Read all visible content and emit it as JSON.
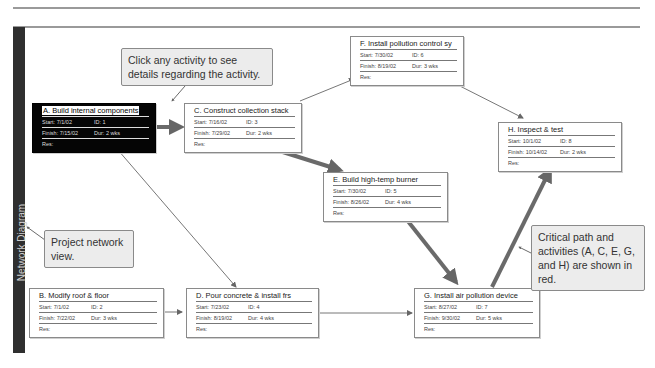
{
  "sidebar": {
    "label": "Network Diagram"
  },
  "callouts": {
    "click_hint": "Click any activity to see details regarding the activity.",
    "network_view": "Project network view.",
    "critical_path": "Critical path and activities (A, C, E, G, and H) are shown in red."
  },
  "activities": [
    {
      "id_letter": "A",
      "title": "A. Build internal components",
      "start": "Start:  7/1/02",
      "id": "ID:   1",
      "finish": "Finish: 7/15/02",
      "dur": "Dur: 2 wks",
      "res": "Res:"
    },
    {
      "id_letter": "B",
      "title": "B. Modify roof & floor",
      "start": "Start:  7/1/02",
      "id": "ID:   2",
      "finish": "Finish: 7/22/02",
      "dur": "Dur: 3 wks",
      "res": "Res:"
    },
    {
      "id_letter": "C",
      "title": "C. Construct collection stack",
      "start": "Start:  7/16/02",
      "id": "ID:   3",
      "finish": "Finish: 7/29/02",
      "dur": "Dur: 2 wks",
      "res": "Res:"
    },
    {
      "id_letter": "D",
      "title": "D. Pour concrete & install frs",
      "start": "Start:  7/23/02",
      "id": "ID:   4",
      "finish": "Finish: 8/19/02",
      "dur": "Dur: 4 wks",
      "res": "Res:"
    },
    {
      "id_letter": "E",
      "title": "E. Build high-temp burner",
      "start": "Start:  7/30/02",
      "id": "ID:   5",
      "finish": "Finish: 8/26/02",
      "dur": "Dur: 4 wks",
      "res": "Res:"
    },
    {
      "id_letter": "F",
      "title": "F. Install pollution control sy",
      "start": "Start:  7/30/02",
      "id": "ID:   6",
      "finish": "Finish: 8/19/02",
      "dur": "Dur: 3 wks",
      "res": "Res:"
    },
    {
      "id_letter": "G",
      "title": "G. Install air pollution device",
      "start": "Start:  8/27/02",
      "id": "ID:   7",
      "finish": "Finish: 9/30/02",
      "dur": "Dur: 5 wks",
      "res": "Res:"
    },
    {
      "id_letter": "H",
      "title": "H. Inspect & test",
      "start": "Start:  10/1/02",
      "id": "ID:   8",
      "finish": "Finish: 10/14/02",
      "dur": "Dur: 2 wks",
      "res": "Res:"
    }
  ],
  "colors": {
    "critical_arrow": "#6a6a6a",
    "normal_arrow": "#777777",
    "sidebar": "#2f2f2f",
    "selected_node": "#050505"
  }
}
